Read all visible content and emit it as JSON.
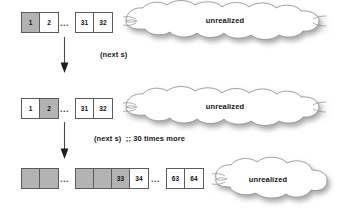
{
  "diagram": {
    "background_color": "#ffffff",
    "cell_fill_color": "#b3b3b3",
    "cell_border_color": "#5b5b5b",
    "cloud_fill_color": "#ffffff",
    "cloud_border_color": "#8c8c8c",
    "ellipsis": "...",
    "rows": [
      {
        "id": "row-1",
        "groups": [
          {
            "cells": [
              {
                "label": "1",
                "filled": true
              },
              {
                "label": "2",
                "filled": false
              }
            ]
          },
          {
            "cells": [
              {
                "label": "31",
                "filled": false
              },
              {
                "label": "32",
                "filled": false
              }
            ]
          }
        ],
        "cloud_label": "unrealized"
      },
      {
        "id": "row-2",
        "groups": [
          {
            "cells": [
              {
                "label": "1",
                "filled": false
              },
              {
                "label": "2",
                "filled": true
              }
            ]
          },
          {
            "cells": [
              {
                "label": "31",
                "filled": false
              },
              {
                "label": "32",
                "filled": false
              }
            ]
          }
        ],
        "cloud_label": "unrealized"
      },
      {
        "id": "row-3",
        "groups": [
          {
            "cells": [
              {
                "label": "",
                "filled": true
              },
              {
                "label": "",
                "filled": true
              }
            ]
          },
          {
            "cells": [
              {
                "label": "",
                "filled": true
              },
              {
                "label": "",
                "filled": true
              },
              {
                "label": "33",
                "filled": true
              },
              {
                "label": "34",
                "filled": false
              }
            ]
          },
          {
            "cells": [
              {
                "label": "63",
                "filled": false
              },
              {
                "label": "64",
                "filled": false
              }
            ]
          }
        ],
        "cloud_label": "unrealized"
      }
    ],
    "transitions": [
      {
        "id": "transition-1",
        "label": "(next s)"
      },
      {
        "id": "transition-2",
        "label": "(next s)  ;; 30 times more"
      }
    ]
  }
}
